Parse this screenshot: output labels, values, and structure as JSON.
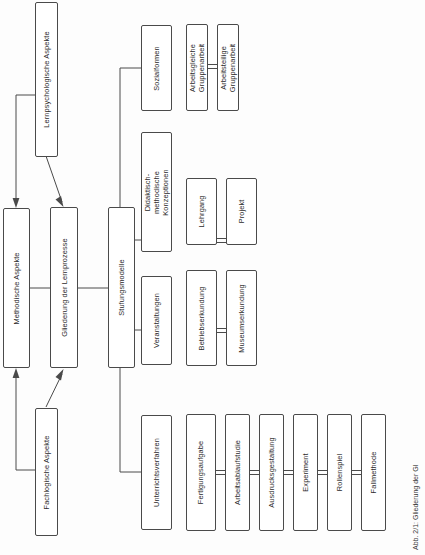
{
  "figure": {
    "caption": "Abb. 2/1:  Gliederung der Gl",
    "orientation": "rotated-90",
    "language": "de"
  },
  "nodes": {
    "lernpsychologische": "Lernpsychologische Aspekte",
    "methodische": "Methodische Aspekte",
    "gliederung": "Gliederung der Lernprozesse",
    "fachlogische": "Fachlogische Aspekte",
    "stufungsmodelle": "Stufungsmodelle",
    "sozialformen": "Sozialformen",
    "arbeitsgleiche": "Arbeitsgleiche Gruppenarbeit",
    "arbeitsteilige": "Arbeitsteilige Gruppenarbeit",
    "didaktisch": "Didaktisch-methodische Konzeptionen",
    "lehrgang": "Lehrgang",
    "projekt": "Projekt",
    "veranstaltungen": "Veranstaltungen",
    "betriebserkundung": "Betriebserkundung",
    "museumserkundung": "Museumserkundung",
    "unterrichtsverfahren": "Unterrichtsverfahren",
    "fertigungsaufgabe": "Fertigungsaufgabe",
    "arbeitsablaufstudie": "Arbeitsablaufstudie",
    "ausdrucksgestaltung": "Ausdrucksgestaltung",
    "experiment": "Experiment",
    "rollenspiel": "Rollenspiel",
    "fallmethode": "Fallmethode"
  },
  "colors": {
    "stroke": "#4a4a4a",
    "text": "#2b2b2b",
    "background": "#ffffff"
  }
}
